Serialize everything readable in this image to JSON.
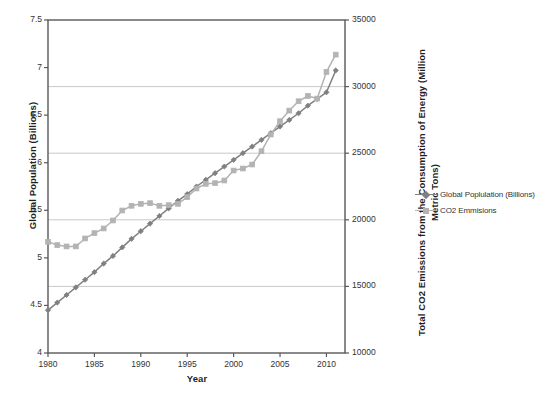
{
  "chart_data": {
    "type": "line",
    "title": "",
    "xlabel": "Year",
    "ylabel": "Global Population (Billions)",
    "y2label": "Total CO2 Emissions from the Consumption of Energy (Million Metric Tons)",
    "grid": true,
    "legend_position": "right",
    "xlim": [
      1980,
      2012
    ],
    "ylim": [
      4,
      7.5
    ],
    "y2lim": [
      10000,
      35000
    ],
    "x_ticks": [
      "1980",
      "1985",
      "1990",
      "1995",
      "2000",
      "2005",
      "2010"
    ],
    "y_ticks": [
      "4",
      "4.5",
      "5",
      "5.5",
      "6",
      "6.5",
      "7",
      "7.5"
    ],
    "y2_ticks": [
      "10000",
      "15000",
      "20000",
      "25000",
      "30000",
      "35000"
    ],
    "x": [
      1980,
      1981,
      1982,
      1983,
      1984,
      1985,
      1986,
      1987,
      1988,
      1989,
      1990,
      1991,
      1992,
      1993,
      1994,
      1995,
      1996,
      1997,
      1998,
      1999,
      2000,
      2001,
      2002,
      2003,
      2004,
      2005,
      2006,
      2007,
      2008,
      2009,
      2010,
      2011
    ],
    "series": [
      {
        "name": "Global Poplulation (Billions)",
        "axis": "left",
        "color": "#808080",
        "marker": "diamond",
        "values": [
          4.45,
          4.53,
          4.61,
          4.69,
          4.77,
          4.85,
          4.94,
          5.02,
          5.11,
          5.2,
          5.28,
          5.36,
          5.44,
          5.52,
          5.6,
          5.67,
          5.75,
          5.82,
          5.89,
          5.96,
          6.03,
          6.1,
          6.17,
          6.24,
          6.31,
          6.38,
          6.45,
          6.52,
          6.6,
          6.67,
          6.74,
          6.97
        ]
      },
      {
        "name": "CO2 Emmisions",
        "axis": "right",
        "color": "#b3b3b3",
        "marker": "square",
        "values": [
          18350,
          18100,
          18000,
          18000,
          18600,
          19000,
          19350,
          19950,
          20700,
          21050,
          21200,
          21250,
          21050,
          21100,
          21200,
          21700,
          22350,
          22700,
          22750,
          22950,
          23700,
          23850,
          24150,
          25150,
          26400,
          27400,
          28200,
          28900,
          29300,
          29100,
          31100,
          32400
        ]
      }
    ],
    "legend": [
      {
        "label": "Global Poplulation (Billions)",
        "color": "#808080",
        "marker": "diamond"
      },
      {
        "label": "CO2 Emmisions",
        "color": "#b3b3b3",
        "marker": "square"
      }
    ]
  },
  "axes": {
    "left_title": "Global Population (Billions)",
    "right_title_line1": "Total CO2 Emissions from the Consumption of Energy (Million",
    "right_title_line2": "Metric Tons)",
    "x_title": "Year"
  },
  "ticks": {
    "left": [
      "7.5",
      "7",
      "6.5",
      "6",
      "5.5",
      "5",
      "4.5",
      "4"
    ],
    "right": [
      "35000",
      "30000",
      "25000",
      "20000",
      "15000",
      "10000"
    ],
    "x": [
      "1980",
      "1985",
      "1990",
      "1995",
      "2000",
      "2005",
      "2010"
    ]
  }
}
